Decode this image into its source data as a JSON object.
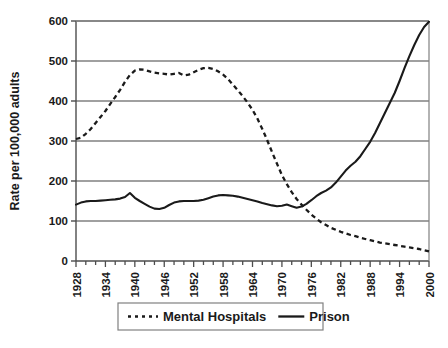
{
  "chart_data": {
    "type": "line",
    "title": "",
    "subtitle": "",
    "xlabel": "",
    "ylabel": "Rate per 100,000 adults",
    "xlim": [
      1928,
      2000
    ],
    "ylim": [
      0,
      600
    ],
    "ytick_values": [
      0,
      100,
      200,
      300,
      400,
      500,
      600
    ],
    "ytick_labels": [
      "0",
      "100",
      "200",
      "300",
      "400",
      "500",
      "600"
    ],
    "xtick_labels": [
      "1928",
      "1934",
      "1940",
      "1946",
      "1952",
      "1958",
      "1964",
      "1970",
      "1976",
      "1982",
      "1988",
      "1994",
      "2000"
    ],
    "xtick_values": [
      1928,
      1934,
      1940,
      1946,
      1952,
      1958,
      1964,
      1970,
      1976,
      1982,
      1988,
      1994,
      2000
    ],
    "minor_tick_interval": 2,
    "grid": "horizontal",
    "legend_position": "bottom",
    "x": [
      1928,
      1929,
      1930,
      1931,
      1932,
      1933,
      1934,
      1935,
      1936,
      1937,
      1938,
      1939,
      1940,
      1941,
      1942,
      1943,
      1944,
      1945,
      1946,
      1947,
      1948,
      1949,
      1950,
      1951,
      1952,
      1953,
      1954,
      1955,
      1956,
      1957,
      1958,
      1959,
      1960,
      1961,
      1962,
      1963,
      1964,
      1965,
      1966,
      1967,
      1968,
      1969,
      1970,
      1971,
      1972,
      1973,
      1974,
      1975,
      1976,
      1977,
      1978,
      1979,
      1980,
      1981,
      1982,
      1983,
      1984,
      1985,
      1986,
      1987,
      1988,
      1989,
      1990,
      1991,
      1992,
      1993,
      1994,
      1995,
      1996,
      1997,
      1998,
      1999,
      2000
    ],
    "series": [
      {
        "name": "Mental Hospitals",
        "style": "dotted",
        "color": "#1a1a1a",
        "values": [
          305,
          308,
          318,
          330,
          345,
          360,
          375,
          393,
          410,
          428,
          448,
          465,
          476,
          479,
          478,
          474,
          471,
          469,
          468,
          466,
          468,
          470,
          464,
          466,
          472,
          478,
          482,
          483,
          480,
          474,
          466,
          455,
          441,
          427,
          412,
          396,
          378,
          356,
          330,
          302,
          272,
          243,
          215,
          192,
          172,
          155,
          141,
          128,
          116,
          106,
          97,
          90,
          83,
          78,
          73,
          69,
          65,
          62,
          58,
          55,
          52,
          49,
          46,
          44,
          42,
          40,
          38,
          36,
          34,
          32,
          30,
          27,
          24
        ]
      },
      {
        "name": "Prison",
        "style": "solid",
        "color": "#1a1a1a",
        "values": [
          141,
          146,
          149,
          150,
          150,
          151,
          152,
          153,
          154,
          156,
          160,
          170,
          158,
          150,
          143,
          136,
          131,
          130,
          133,
          140,
          146,
          149,
          150,
          150,
          150,
          151,
          153,
          157,
          161,
          164,
          165,
          164,
          163,
          161,
          158,
          155,
          152,
          149,
          145,
          142,
          139,
          137,
          138,
          141,
          137,
          133,
          136,
          143,
          152,
          162,
          170,
          176,
          184,
          196,
          211,
          226,
          238,
          248,
          262,
          280,
          298,
          320,
          345,
          370,
          395,
          420,
          450,
          482,
          512,
          540,
          565,
          585,
          598
        ]
      }
    ]
  },
  "legend": {
    "entries": [
      {
        "label": "Mental Hospitals",
        "style": "dotted"
      },
      {
        "label": "Prison",
        "style": "solid"
      }
    ]
  },
  "colors": {
    "line": "#1a1a1a",
    "grid": "#808080",
    "axis": "#4d4d4d",
    "background": "#ffffff",
    "legend_border": "#808080"
  }
}
